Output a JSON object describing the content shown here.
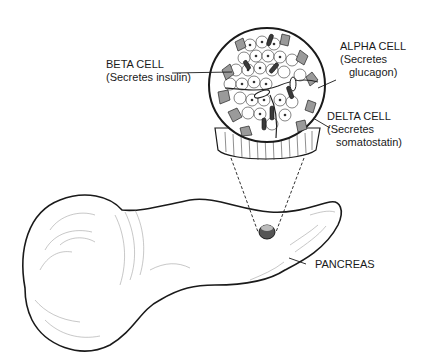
{
  "diagram": {
    "labels": {
      "beta": {
        "title": "BETA CELL",
        "sub": "(Secretes insulin)"
      },
      "alpha": {
        "title": "ALPHA CELL",
        "sub1": "(Secretes",
        "sub2": "glucagon)"
      },
      "delta": {
        "title": "DELTA CELL",
        "sub1": "(Secretes",
        "sub2": "somatostatin)"
      },
      "organ": {
        "title": "PANCREAS"
      }
    },
    "colors": {
      "ink": "#1a1a1a",
      "background": "#ffffff",
      "cell_shade": "#9a9a9a"
    }
  }
}
